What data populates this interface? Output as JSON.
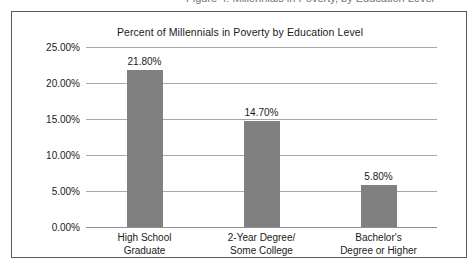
{
  "caption_fragment": "Figure 4: Millennials in Poverty, by Education Level",
  "chart_data": {
    "type": "bar",
    "title": "Percent of Millennials in Poverty by Education Level",
    "xlabel": "",
    "ylabel": "",
    "ylim": [
      0,
      25
    ],
    "grid": true,
    "legend": false,
    "bar_color": "#808080",
    "categories": [
      "High School\nGraduate",
      "2-Year Degree/\nSome College",
      "Bachelor's\nDegree or Higher"
    ],
    "category_lines": [
      [
        "High School",
        "Graduate"
      ],
      [
        "2-Year Degree/",
        "Some College"
      ],
      [
        "Bachelor's",
        "Degree or Higher"
      ]
    ],
    "values": [
      21.8,
      14.7,
      5.8
    ],
    "value_labels": [
      "21.80%",
      "14.70%",
      "5.80%"
    ],
    "ticks": [
      0,
      5,
      10,
      15,
      20,
      25
    ],
    "tick_labels": [
      "0.00%",
      "5.00%",
      "10.00%",
      "15.00%",
      "20.00%",
      "25.00%"
    ]
  }
}
